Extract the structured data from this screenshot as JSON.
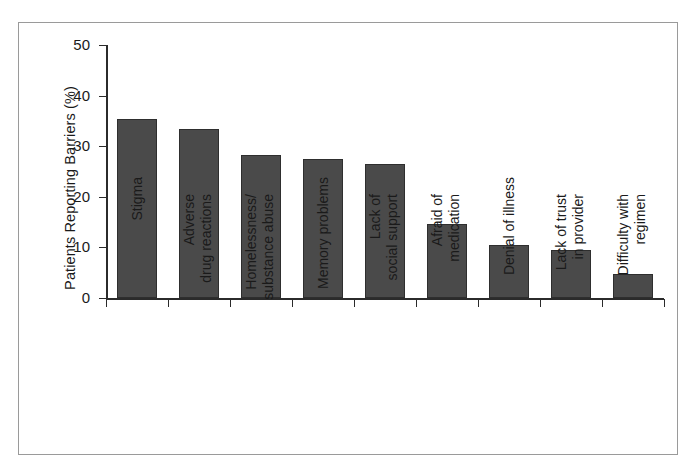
{
  "chart_data": {
    "type": "bar",
    "title": "",
    "subtitle": "",
    "xlabel": "",
    "ylabel": "Patients Reporting Barriers (%)",
    "ylim": [
      0,
      50
    ],
    "yticks": [
      0,
      10,
      20,
      30,
      40,
      50
    ],
    "ytick_labels": [
      "0",
      "10",
      "20",
      "30",
      "40",
      "50"
    ],
    "grid": false,
    "legend": null,
    "bar_color": "#4a4a4a",
    "bar_edge_color": "#2e2e2e",
    "categories": [
      "Stigma",
      "Adverse drug reactions",
      "Homelessness/ substance abuse",
      "Memory problems",
      "Lack of social support",
      "Afraid of medication",
      "Denial of illness",
      "Lack of trust in provider",
      "Difficulty with regimen"
    ],
    "category_lines": [
      [
        "Stigma"
      ],
      [
        "Adverse",
        "drug reactions"
      ],
      [
        "Homelessness/",
        "substance abuse"
      ],
      [
        "Memory problems"
      ],
      [
        "Lack of",
        "social support"
      ],
      [
        "Afraid of",
        "medication"
      ],
      [
        "Denial of illness"
      ],
      [
        "Lack of trust",
        "in provider"
      ],
      [
        "Difficulty with",
        "regimen"
      ]
    ],
    "values": [
      35.4,
      33.4,
      28.3,
      27.4,
      26.4,
      14.6,
      10.4,
      9.4,
      4.7
    ]
  }
}
